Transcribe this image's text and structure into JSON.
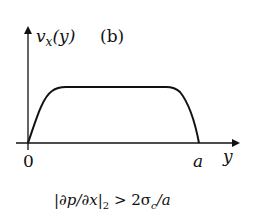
{
  "figure": {
    "panel_label": "(b)",
    "y_axis_label": {
      "main": "v",
      "sub": "x",
      "arg": "(y)"
    },
    "x_axis_label": "y",
    "x_ticks": [
      {
        "label": "0",
        "position": "origin"
      },
      {
        "label": "a",
        "position": "right-wall"
      }
    ],
    "condition": {
      "prefix": "|∂p/∂x|",
      "sub": "2",
      "relation": " > 2σ",
      "sigma_sub": "c",
      "suffix": "/a"
    },
    "curve_description": "Plug-flow velocity profile: rises steeply from 0 at y=0, flat plateau in the middle, falls steeply to 0 at y=a",
    "colors": {
      "ink": "#111111",
      "background": "#ffffff"
    }
  }
}
